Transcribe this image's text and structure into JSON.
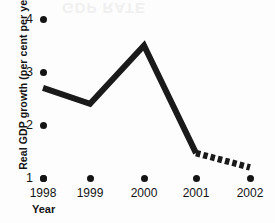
{
  "chart_data": {
    "type": "line",
    "title": "",
    "xlabel": "Year",
    "ylabel": "Real GDP growth (per cent per year)",
    "categories": [
      "1998",
      "1999",
      "2000",
      "2001",
      "2002"
    ],
    "x": [
      1998,
      1999,
      2000,
      2001,
      2002
    ],
    "values": [
      2.7,
      2.4,
      3.5,
      1.47,
      1.2
    ],
    "series": [
      {
        "name": "Real GDP growth",
        "style": "solid",
        "note": "actual",
        "points": [
          {
            "x": "1998",
            "y": 2.7
          },
          {
            "x": "1999",
            "y": 2.4
          },
          {
            "x": "2000",
            "y": 3.5
          },
          {
            "x": "2001",
            "y": 1.47
          }
        ]
      },
      {
        "name": "Real GDP growth (projected)",
        "style": "dashed",
        "note": "forecast",
        "points": [
          {
            "x": "2001",
            "y": 1.47
          },
          {
            "x": "2002",
            "y": 1.2
          }
        ]
      }
    ],
    "ylim": [
      1,
      4
    ],
    "yticks": [
      1,
      2,
      3,
      4
    ],
    "ytick_labels": [
      "1",
      "2",
      "3",
      "4"
    ],
    "xtick_labels": [
      "1998",
      "1999",
      "2000",
      "2001",
      "2002"
    ],
    "grid": false,
    "legend": false,
    "legend_position": "none",
    "line_color": "#1a1a1a",
    "tick_marker": "dot",
    "artifact_text": "GDP RATE"
  }
}
